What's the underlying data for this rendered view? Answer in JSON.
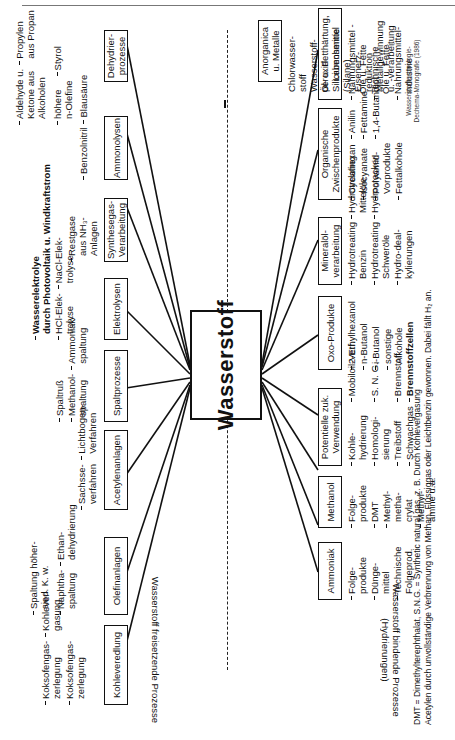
{
  "center": {
    "label": "Wasserstoff"
  },
  "side_labels": {
    "releasing": "Wasserstoff freisetzende Prozesse",
    "binding_line1": "Wasserstoff bindende Prozesse",
    "binding_line2": "(Hydrierungen)"
  },
  "releasing_processes": [
    {
      "label": "Kohleveredlung",
      "items": [
        "Koksofengas-\nzerlegung",
        "Kohlever-\ngasung"
      ]
    },
    {
      "label": "Olefinanlagen",
      "items": [
        "Spaltung höher-\nsied. K. w.",
        "Naphtha-\nspaltung",
        "Ethan-\ndehydrierung"
      ]
    },
    {
      "label": "Acetylenanlagen",
      "items": [
        "Sachsse-\nverfahren",
        "Lichtbogen-\nVerfahren"
      ]
    },
    {
      "label": "Spaltprozesse",
      "items": [
        "Spaltruß",
        "Methanol-\nspaltung",
        "Ammoniak-\nspaltung"
      ]
    },
    {
      "label": "Elektrolysen",
      "items": [
        "Wasserelektrolye\ndurch Photovoltaik u. Windkraftstrom",
        "HCl-Elek-\ntrolyse",
        "NaCl-Elek-\ntrolyse"
      ]
    },
    {
      "label": "Synthesegas-\nVerarbeitung",
      "items": [
        "Restgase\naus NH₃-\nAnlagen"
      ]
    },
    {
      "label": "Ammonolysen",
      "items": [
        "Benzolnitril",
        "Blausäure"
      ]
    },
    {
      "label": "Dehydrier-\nprozesse",
      "items": [
        "Aldehyde u.\nKetone aus\nAlkoholen",
        "Propylen\naus Propan",
        "höhere\nn-Olefine",
        "Styrol"
      ]
    }
  ],
  "binding_processes": [
    {
      "label": "Ammoniak",
      "items": [
        "Folge-\nprodukte",
        "Dünge-\nmittel",
        "Technische\nFolgeprod."
      ]
    },
    {
      "label": "Methanol",
      "items": [
        "Folge-\nprodukte",
        "DMT",
        "Methyl-\nmetha-\ncrylat",
        "Methyl-\namine u.a."
      ]
    },
    {
      "label": "Potentielle zuk.\nVerwendung",
      "items": [
        "Kohle-\nhydrierung",
        "Mobiloil-Verf.",
        "Homologi-\nsierung",
        "S. N. G.",
        "Treibstoff",
        "Brennstoff",
        "Schwachgas",
        "Brennstoffzellen"
      ]
    },
    {
      "label": "Oxo-Produkte",
      "items": [
        "2-Ethylhexanol",
        "n-Butanol",
        "i-Butanol",
        "sonstige\nAlkohole"
      ]
    },
    {
      "label": "Mineralöl-\nverarbeitung",
      "items": [
        "Hydrotreating\nBenzin",
        "Hydrotreating\nMittelöle",
        "Hydrotreating\nSchweröle",
        "Hydrocracker",
        "Hydro-deal-\nkylierungen"
      ]
    },
    {
      "label": "Organische\nZwischenprodukte",
      "items": [
        "Cyclohexan",
        "Anilin",
        "Isocyanate",
        "Fettamine",
        "Polyamid-\nVorprodukte",
        "1,4-Butandiol",
        "Fettalkohole"
      ]
    },
    {
      "label": "Öl- u. Fetthärtung,\nLebensmittel",
      "items": [
        "Nahrungsmittel -\nÖle u. Fette",
        "Technische\nÖle u. Fette",
        "Nahrungsmittel-\nindustrie"
      ]
    },
    {
      "label": "Anorganica\nu. Metalle",
      "items": [
        "Chlorwasser-\nstoff",
        "Wasserstoff-\nperoxid",
        "Siliciumchemie\n(Silane)",
        "Eisenerz-\nreduktion",
        "Metallgewinnung\nu. -verarbeitung"
      ]
    }
  ],
  "footnotes": {
    "line1": "DMT = Dimethylterephthalat, S.N.G. = Synthetic natural gas, z. B. Durch Kohlevergasung",
    "line2": "Acetylen durch unvollständige Verbrennung von Methan, Flüssiggas oder Leichtbenzin gewonnen. Dabei fällt H₂ an."
  },
  "citation": {
    "line1": "Wasserstofftechnologie-",
    "line2": "Dechema-Monografie (1986)"
  },
  "marker": "I"
}
